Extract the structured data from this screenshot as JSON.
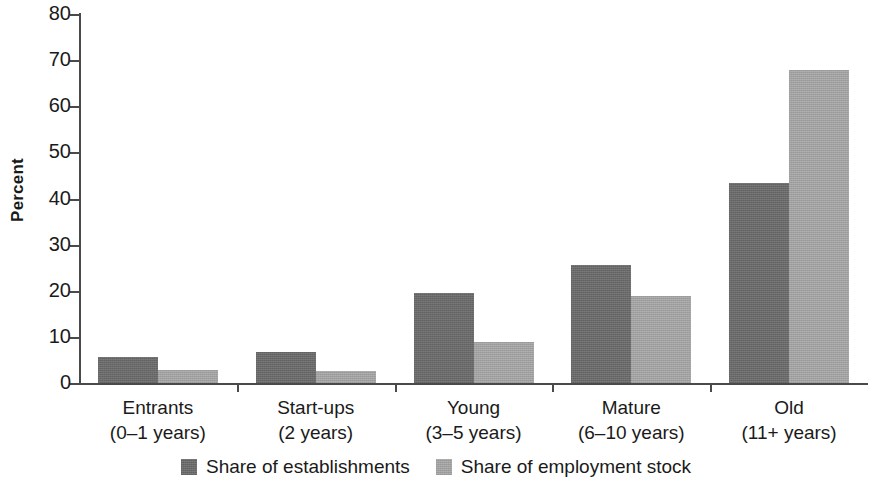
{
  "chart_data": {
    "type": "bar",
    "title": "",
    "xlabel": "",
    "ylabel": "Percent",
    "ylim": [
      0,
      80
    ],
    "ytick_labels": [
      "80",
      "70",
      "60",
      "50",
      "40",
      "30",
      "20",
      "10",
      "0"
    ],
    "ytick_values": [
      80,
      70,
      60,
      50,
      40,
      30,
      20,
      10,
      0
    ],
    "grid": false,
    "legend_position": "bottom-center",
    "categories": [
      "Entrants",
      "Start-ups",
      "Young",
      "Mature",
      "Old"
    ],
    "category_sublabels": [
      "(0–1 years)",
      "(2 years)",
      "(3–5 years)",
      "(6–10 years)",
      "(11+ years)"
    ],
    "series": [
      {
        "name": "Share of establishments",
        "color": "#6d6d6d",
        "values": [
          5.6,
          6.7,
          19.5,
          25.6,
          43.4
        ]
      },
      {
        "name": "Share of employment stock",
        "color": "#a9a9a9",
        "values": [
          2.9,
          2.5,
          8.8,
          18.8,
          67.8
        ]
      }
    ]
  },
  "axis": {
    "y_title": "Percent"
  },
  "legend": {
    "items": [
      {
        "label": "Share of establishments",
        "swatch": "dark"
      },
      {
        "label": "Share of employment stock",
        "swatch": "light"
      }
    ]
  }
}
